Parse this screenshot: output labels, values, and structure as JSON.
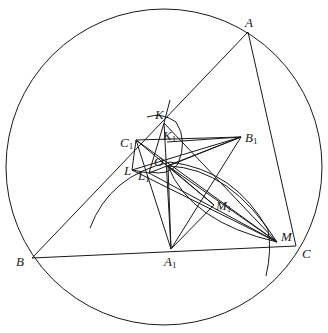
{
  "diagram": {
    "circle": {
      "cx": 164,
      "cy": 167,
      "r": 158
    },
    "points": {
      "A": {
        "x": 248,
        "y": 32,
        "label": "A",
        "sub": ""
      },
      "B": {
        "x": 32,
        "y": 258,
        "label": "B",
        "sub": ""
      },
      "C": {
        "x": 296,
        "y": 246,
        "label": "C",
        "sub": ""
      },
      "A1": {
        "x": 171,
        "y": 249,
        "label": "A",
        "sub": "1"
      },
      "B1": {
        "x": 241,
        "y": 137,
        "label": "B",
        "sub": "1"
      },
      "C1": {
        "x": 136,
        "y": 140,
        "label": "C",
        "sub": "1"
      },
      "K": {
        "x": 164,
        "y": 123,
        "label": "K",
        "sub": ""
      },
      "K1": {
        "x": 167,
        "y": 142,
        "label": "K",
        "sub": "1"
      },
      "O": {
        "x": 168,
        "y": 166,
        "label": "O",
        "sub": ""
      },
      "L": {
        "x": 132,
        "y": 170,
        "label": "L",
        "sub": ""
      },
      "L1": {
        "x": 149,
        "y": 173,
        "label": "L",
        "sub": "1"
      },
      "M1": {
        "x": 214,
        "y": 205,
        "label": "M",
        "sub": "1"
      },
      "M": {
        "x": 277,
        "y": 242,
        "label": "M",
        "sub": ""
      }
    },
    "labels": [
      {
        "id": "A",
        "text": "A",
        "sub": "",
        "x": 245,
        "y": 27
      },
      {
        "id": "B",
        "text": "B",
        "sub": "",
        "x": 16,
        "y": 266
      },
      {
        "id": "C",
        "text": "C",
        "sub": "",
        "x": 302,
        "y": 258
      },
      {
        "id": "A1",
        "text": "A",
        "sub": "1",
        "x": 164,
        "y": 266
      },
      {
        "id": "B1",
        "text": "B",
        "sub": "1",
        "x": 245,
        "y": 142
      },
      {
        "id": "C1",
        "text": "C",
        "sub": "1",
        "x": 120,
        "y": 147
      },
      {
        "id": "K",
        "text": "K",
        "sub": "",
        "x": 155,
        "y": 119
      },
      {
        "id": "K1",
        "text": "K",
        "sub": "1",
        "x": 163,
        "y": 140
      },
      {
        "id": "O",
        "text": "O",
        "sub": "",
        "x": 154,
        "y": 166
      },
      {
        "id": "L",
        "text": "L",
        "sub": "",
        "x": 124,
        "y": 175
      },
      {
        "id": "L1",
        "text": "L",
        "sub": "1",
        "x": 138,
        "y": 180
      },
      {
        "id": "M1",
        "text": "M",
        "sub": "1",
        "x": 216,
        "y": 210
      },
      {
        "id": "M",
        "text": "M",
        "sub": "",
        "x": 281,
        "y": 241
      }
    ]
  }
}
